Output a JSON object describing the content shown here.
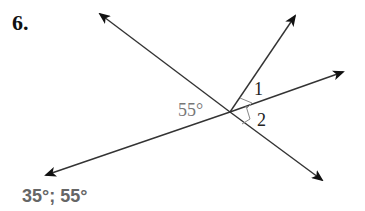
{
  "problem": {
    "number": "6.",
    "answer": "35°; 55°"
  },
  "diagram": {
    "angle_given": "55°",
    "angle_labels": [
      "1",
      "2"
    ],
    "colors": {
      "line": "#333333",
      "given_label": "#777777",
      "angle_label": "#222222",
      "answer": "#666666"
    }
  }
}
